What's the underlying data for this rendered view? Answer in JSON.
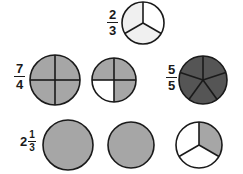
{
  "page": {
    "width": 243,
    "height": 174,
    "background": "#ffffff",
    "topic": "fraction-circle-models"
  },
  "colors": {
    "outline": "#1a1a1a",
    "text": "#1a1a1a",
    "shade_light": "#f0f0f0",
    "shade_medium": "#a6a6a6",
    "shade_dark": "#555555",
    "unshaded": "#ffffff"
  },
  "labels": [
    {
      "id": "label-two-thirds",
      "kind": "fraction",
      "numerator": "2",
      "denominator": "3",
      "text": "2/3",
      "x": 107,
      "y": 8
    },
    {
      "id": "label-seven-fourths",
      "kind": "fraction",
      "numerator": "7",
      "denominator": "4",
      "text": "7/4",
      "x": 14,
      "y": 62
    },
    {
      "id": "label-five-fifths",
      "kind": "fraction",
      "numerator": "5",
      "denominator": "5",
      "text": "5/5",
      "x": 166,
      "y": 63
    },
    {
      "id": "label-two-and-one-third",
      "kind": "mixed",
      "whole": "2",
      "numerator": "1",
      "denominator": "3",
      "text": "2 1/3",
      "x": 20,
      "y": 130
    }
  ],
  "figures": [
    {
      "id": "circle-two-thirds",
      "name": "fraction-circle-2-3",
      "row": 1,
      "cx": 143,
      "cy": 23,
      "r": 21,
      "segments": 3,
      "shaded_count": 2,
      "start_angle": -90,
      "fill": "#f0f0f0",
      "shaded_indices": [
        1,
        2
      ],
      "represents": "2/3"
    },
    {
      "id": "circle-row2-a",
      "name": "fraction-circle-four-fourths-full",
      "row": 2,
      "cx": 55,
      "cy": 80,
      "r": 25,
      "segments": 4,
      "shaded_count": 4,
      "start_angle": -90,
      "fill": "#a6a6a6",
      "shaded_indices": [
        0,
        1,
        2,
        3
      ],
      "represents": "4/4"
    },
    {
      "id": "circle-row2-b",
      "name": "fraction-circle-three-fourths",
      "row": 2,
      "cx": 114,
      "cy": 80,
      "r": 22,
      "segments": 4,
      "shaded_count": 3,
      "start_angle": -90,
      "fill": "#a6a6a6",
      "shaded_indices": [
        0,
        1,
        3
      ],
      "represents": "3/4"
    },
    {
      "id": "circle-five-fifths",
      "name": "fraction-circle-5-5",
      "row": 2,
      "cx": 203,
      "cy": 80,
      "r": 24,
      "segments": 5,
      "shaded_count": 5,
      "start_angle": -90,
      "fill": "#555555",
      "shaded_indices": [
        0,
        1,
        2,
        3,
        4
      ],
      "represents": "5/5"
    },
    {
      "id": "circle-row3-a",
      "name": "fraction-circle-whole-a",
      "row": 3,
      "cx": 68,
      "cy": 145,
      "r": 25,
      "segments": 1,
      "shaded_count": 1,
      "start_angle": -90,
      "fill": "#a6a6a6",
      "shaded_indices": [
        0
      ],
      "represents": "1 whole"
    },
    {
      "id": "circle-row3-b",
      "name": "fraction-circle-whole-b",
      "row": 3,
      "cx": 131,
      "cy": 145,
      "r": 23,
      "segments": 1,
      "shaded_count": 1,
      "start_angle": -90,
      "fill": "#a6a6a6",
      "shaded_indices": [
        0
      ],
      "represents": "1 whole"
    },
    {
      "id": "circle-row3-c",
      "name": "fraction-circle-one-third",
      "row": 3,
      "cx": 199,
      "cy": 145,
      "r": 23,
      "segments": 3,
      "shaded_count": 1,
      "start_angle": 30,
      "fill": "#a6a6a6",
      "shaded_indices": [
        2
      ],
      "represents": "1/3"
    }
  ]
}
